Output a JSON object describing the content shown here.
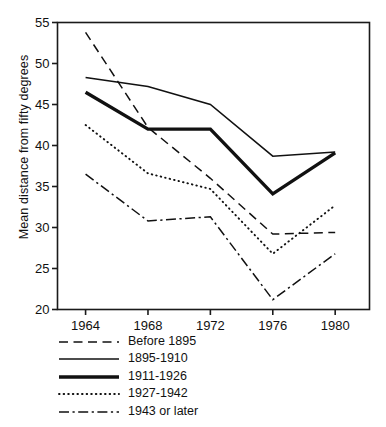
{
  "chart_data": {
    "type": "line",
    "title": "",
    "xlabel": "",
    "ylabel": "Mean distance from fifty degrees",
    "x": [
      1964,
      1968,
      1972,
      1976,
      1980
    ],
    "xticklabels": [
      "1964",
      "1968",
      "1972",
      "1976",
      "1980"
    ],
    "yticklabels": [
      "20",
      "25",
      "30",
      "35",
      "40",
      "45",
      "50",
      "55"
    ],
    "yticks": [
      20,
      25,
      30,
      35,
      40,
      45,
      50,
      55
    ],
    "ylim": [
      20,
      55
    ],
    "xlim": [
      1962.2,
      1982.2
    ],
    "grid": false,
    "legend_position": "below-axes-left",
    "series": [
      {
        "name": "Before 1895",
        "style": "dashed",
        "values": [
          53.8,
          42.2,
          36.0,
          29.2,
          29.4
        ]
      },
      {
        "name": "1895-1910",
        "style": "solid-thin",
        "values": [
          48.3,
          47.2,
          45.0,
          38.7,
          39.2
        ]
      },
      {
        "name": "1911-1926",
        "style": "solid-thick",
        "values": [
          46.5,
          42.0,
          42.0,
          34.1,
          39.1
        ]
      },
      {
        "name": "1927-1942",
        "style": "dotted",
        "values": [
          42.5,
          36.6,
          34.7,
          26.8,
          32.7
        ]
      },
      {
        "name": "1943 or later",
        "style": "dash-dot",
        "values": [
          36.5,
          30.8,
          31.3,
          21.2,
          26.8
        ]
      }
    ]
  },
  "legend": {
    "items": [
      {
        "label": "Before 1895"
      },
      {
        "label": "1895-1910"
      },
      {
        "label": "1911-1926"
      },
      {
        "label": "1927-1942"
      },
      {
        "label": "1943 or later"
      }
    ]
  }
}
